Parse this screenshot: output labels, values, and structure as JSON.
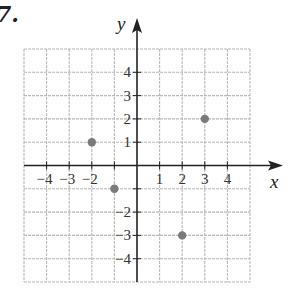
{
  "problem_number": "7.",
  "chart_data": {
    "type": "scatter",
    "title": "",
    "xlabel": "x",
    "ylabel": "y",
    "xlim": [
      -5,
      5
    ],
    "ylim": [
      -5,
      5
    ],
    "grid": true,
    "x_tick_labels": [
      "-4",
      "-3",
      "-2",
      "1",
      "2",
      "3",
      "4"
    ],
    "x_tick_values": [
      -4,
      -3,
      -2,
      1,
      2,
      3,
      4
    ],
    "y_tick_labels": [
      "4",
      "3",
      "2",
      "1",
      "-2",
      "-3",
      "-4"
    ],
    "y_tick_values": [
      4,
      3,
      2,
      1,
      -2,
      -3,
      -4
    ],
    "points": [
      {
        "x": -2,
        "y": 1
      },
      {
        "x": -1,
        "y": -1
      },
      {
        "x": 2,
        "y": -3
      },
      {
        "x": 3,
        "y": 2
      }
    ],
    "colors": {
      "grid": "#b8b8b8",
      "axis": "#222222",
      "point": "#7a7a7a"
    }
  }
}
